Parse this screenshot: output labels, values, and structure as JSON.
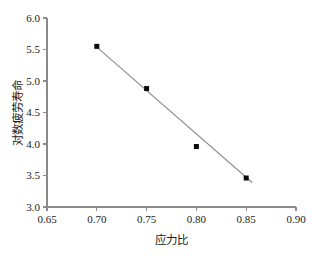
{
  "chart_data": {
    "type": "scatter",
    "title": "",
    "xlabel": "应力比",
    "ylabel": "对数疲劳寿命",
    "xlim": [
      0.65,
      0.9
    ],
    "ylim": [
      3.0,
      6.0
    ],
    "xticks": [
      "0.65",
      "0.70",
      "0.75",
      "0.80",
      "0.85",
      "0.90"
    ],
    "xtick_values": [
      0.65,
      0.7,
      0.75,
      0.8,
      0.85,
      0.9
    ],
    "yticks": [
      "3.0",
      "3.5",
      "4.0",
      "4.5",
      "5.0",
      "5.5",
      "6.0"
    ],
    "ytick_values": [
      3.0,
      3.5,
      4.0,
      4.5,
      5.0,
      5.5,
      6.0
    ],
    "grid": false,
    "legend": null,
    "marker": "filled-square",
    "marker_color": "#0b0b0b",
    "line_color": "#8f8f8f",
    "axis_color": "#8a8a8a",
    "x": [
      0.7,
      0.75,
      0.8,
      0.85
    ],
    "values": [
      5.55,
      4.88,
      3.96,
      3.46
    ],
    "series": [
      {
        "name": "实测数据",
        "x": [
          0.7,
          0.75,
          0.8,
          0.85
        ],
        "values": [
          5.55,
          4.88,
          3.96,
          3.46
        ]
      },
      {
        "name": "拟合直线",
        "type": "line",
        "x": [
          0.698,
          0.856
        ],
        "values": [
          5.565,
          3.39
        ]
      }
    ]
  }
}
